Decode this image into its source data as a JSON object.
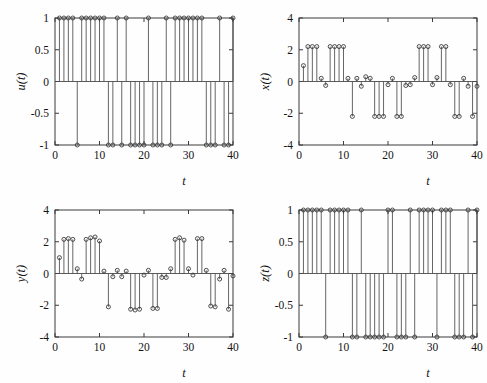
{
  "figure": {
    "title": "",
    "background_color": "#ffffff",
    "line_color": "#4a4a4a",
    "marker_color": "#3a3a3a",
    "layout": "2x2 grid of stem plots",
    "panel_count": 4
  },
  "chart_data": [
    {
      "id": "u",
      "type": "line",
      "plot_style": "stem",
      "title": "",
      "xlabel": "t",
      "ylabel": "u(t)",
      "xlim": [
        0,
        40
      ],
      "ylim": [
        -1,
        1
      ],
      "xticks": [
        0,
        10,
        20,
        30,
        40
      ],
      "xticklabels": [
        "0",
        "10",
        "20",
        "30",
        "40"
      ],
      "yticks": [
        -1,
        -0.5,
        0,
        0.5,
        1
      ],
      "yticklabels": [
        "-1",
        "-0.5",
        "0",
        "0.5",
        "1"
      ],
      "grid": false,
      "legend": "none",
      "position": "top-left",
      "x": [
        1,
        2,
        3,
        4,
        5,
        6,
        7,
        8,
        9,
        10,
        11,
        12,
        13,
        14,
        15,
        16,
        17,
        18,
        19,
        20,
        21,
        22,
        23,
        24,
        25,
        26,
        27,
        28,
        29,
        30,
        31,
        32,
        33,
        34,
        35,
        36,
        37,
        38,
        39,
        40
      ],
      "values": [
        1,
        1,
        1,
        1,
        -1,
        1,
        1,
        1,
        1,
        1,
        1,
        -1,
        -1,
        1,
        -1,
        1,
        -1,
        -1,
        -1,
        -1,
        1,
        -1,
        -1,
        -1,
        1,
        -1,
        1,
        1,
        1,
        1,
        1,
        1,
        1,
        -1,
        -1,
        -1,
        1,
        -1,
        -1,
        1
      ]
    },
    {
      "id": "x",
      "type": "line",
      "plot_style": "stem",
      "title": "",
      "xlabel": "t",
      "ylabel": "x(t)",
      "xlim": [
        0,
        40
      ],
      "ylim": [
        -4,
        4
      ],
      "xticks": [
        0,
        10,
        20,
        30,
        40
      ],
      "xticklabels": [
        "0",
        "10",
        "20",
        "30",
        "40"
      ],
      "yticks": [
        -4,
        -2,
        0,
        2,
        4
      ],
      "yticklabels": [
        "-4",
        "-2",
        "0",
        "2",
        "4"
      ],
      "grid": false,
      "legend": "none",
      "position": "top-right",
      "x": [
        1,
        2,
        3,
        4,
        5,
        6,
        7,
        8,
        9,
        10,
        11,
        12,
        13,
        14,
        15,
        16,
        17,
        18,
        19,
        20,
        21,
        22,
        23,
        24,
        25,
        26,
        27,
        28,
        29,
        30,
        31,
        32,
        33,
        34,
        35,
        36,
        37,
        38,
        39,
        40
      ],
      "values": [
        1.0,
        2.2,
        2.2,
        2.2,
        0.2,
        -0.25,
        2.2,
        2.2,
        2.2,
        2.2,
        0.2,
        -2.2,
        0.2,
        -0.3,
        0.3,
        0.2,
        -2.2,
        -2.2,
        -2.2,
        -0.2,
        0.2,
        -2.2,
        -2.2,
        -0.25,
        -0.2,
        0.25,
        2.2,
        2.2,
        2.2,
        -0.2,
        0.25,
        2.2,
        2.2,
        -0.2,
        -2.2,
        -2.2,
        0.2,
        -0.3,
        -2.2,
        -0.3
      ]
    },
    {
      "id": "y",
      "type": "line",
      "plot_style": "stem",
      "title": "",
      "xlabel": "t",
      "ylabel": "y(t)",
      "xlim": [
        0,
        40
      ],
      "ylim": [
        -4,
        4
      ],
      "xticks": [
        0,
        10,
        20,
        30,
        40
      ],
      "xticklabels": [
        "0",
        "10",
        "20",
        "30",
        "40"
      ],
      "yticks": [
        -4,
        -2,
        0,
        2,
        4
      ],
      "yticklabels": [
        "-4",
        "-2",
        "0",
        "2",
        "4"
      ],
      "grid": false,
      "legend": "none",
      "position": "bottom-left",
      "x": [
        1,
        2,
        3,
        4,
        5,
        6,
        7,
        8,
        9,
        10,
        11,
        12,
        13,
        14,
        15,
        16,
        17,
        18,
        19,
        20,
        21,
        22,
        23,
        24,
        25,
        26,
        27,
        28,
        29,
        30,
        31,
        32,
        33,
        34,
        35,
        36,
        37,
        38,
        39,
        40
      ],
      "values": [
        1.0,
        2.15,
        2.2,
        2.15,
        0.3,
        -0.35,
        2.15,
        2.25,
        2.3,
        2.05,
        0.15,
        -2.1,
        -0.2,
        0.2,
        -0.2,
        0.15,
        -2.25,
        -2.3,
        -2.25,
        -0.1,
        0.2,
        -2.2,
        -2.2,
        -0.25,
        -0.25,
        0.3,
        2.15,
        2.25,
        2.1,
        0.3,
        -0.1,
        2.2,
        2.2,
        0.2,
        -2.05,
        -2.1,
        -0.35,
        0.2,
        -2.25,
        -0.15
      ]
    },
    {
      "id": "z",
      "type": "line",
      "plot_style": "stem",
      "title": "",
      "xlabel": "t",
      "ylabel": "z(t)",
      "xlim": [
        0,
        40
      ],
      "ylim": [
        -1,
        1
      ],
      "xticks": [
        0,
        10,
        20,
        30,
        40
      ],
      "xticklabels": [
        "0",
        "10",
        "20",
        "30",
        "40"
      ],
      "yticks": [
        -1,
        -0.5,
        0,
        0.5,
        1
      ],
      "yticklabels": [
        "-1",
        "-0.5",
        "0",
        "0.5",
        "1"
      ],
      "grid": false,
      "legend": "none",
      "position": "bottom-right",
      "x": [
        1,
        2,
        3,
        4,
        5,
        6,
        7,
        8,
        9,
        10,
        11,
        12,
        13,
        14,
        15,
        16,
        17,
        18,
        19,
        20,
        21,
        22,
        23,
        24,
        25,
        26,
        27,
        28,
        29,
        30,
        31,
        32,
        33,
        34,
        35,
        36,
        37,
        38,
        39,
        40
      ],
      "values": [
        1,
        1,
        1,
        1,
        1,
        -1,
        1,
        1,
        1,
        1,
        1,
        -1,
        -1,
        1,
        -1,
        -1,
        -1,
        -1,
        -1,
        1,
        1,
        -1,
        -1,
        -1,
        1,
        -1,
        1,
        1,
        1,
        1,
        -1,
        1,
        1,
        1,
        -1,
        -1,
        -1,
        1,
        -1,
        1
      ]
    }
  ]
}
